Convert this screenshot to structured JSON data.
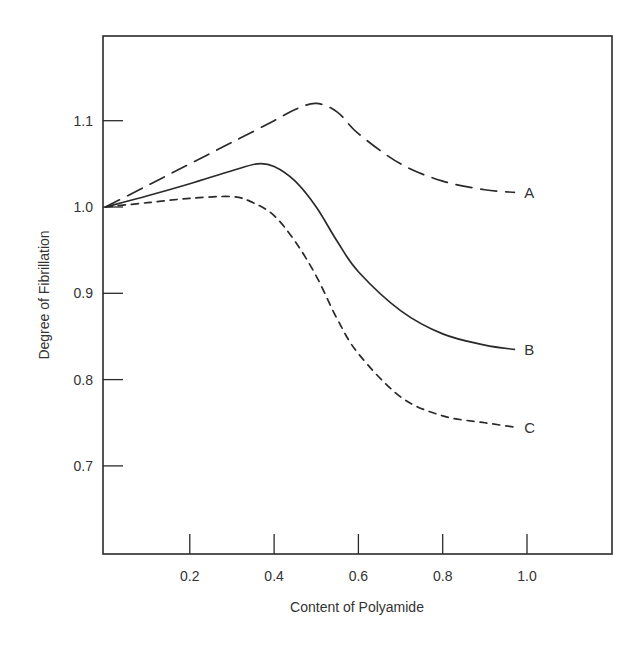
{
  "chart_data": {
    "type": "line",
    "title": "",
    "xlabel": "Content of Polyamide",
    "ylabel": "Degree of Fibrillation",
    "xlim": [
      0,
      1.18
    ],
    "ylim": [
      0.61,
      1.2
    ],
    "x_ticks": [
      0.2,
      0.4,
      0.6,
      0.8,
      1.0
    ],
    "x_tick_labels": [
      "0.2",
      "0.4",
      "0.6",
      "0.8",
      "1.0"
    ],
    "y_ticks": [
      0.7,
      0.8,
      0.9,
      1.0,
      1.1
    ],
    "y_tick_labels": [
      "0.7",
      "0.8",
      "0.9",
      "1.0",
      "1.1"
    ],
    "grid": false,
    "legend": "inline curve labels at right end",
    "series": [
      {
        "name": "A",
        "style": "long-dash",
        "x": [
          0.0,
          0.1,
          0.2,
          0.3,
          0.4,
          0.45,
          0.5,
          0.55,
          0.6,
          0.7,
          0.8,
          0.9,
          0.97
        ],
        "y": [
          1.0,
          1.025,
          1.05,
          1.075,
          1.1,
          1.113,
          1.12,
          1.11,
          1.085,
          1.05,
          1.03,
          1.02,
          1.017
        ]
      },
      {
        "name": "B",
        "style": "solid",
        "x": [
          0.0,
          0.1,
          0.2,
          0.3,
          0.36,
          0.4,
          0.45,
          0.5,
          0.55,
          0.6,
          0.7,
          0.8,
          0.9,
          0.97
        ],
        "y": [
          1.0,
          1.013,
          1.027,
          1.042,
          1.05,
          1.047,
          1.03,
          1.0,
          0.96,
          0.925,
          0.88,
          0.853,
          0.84,
          0.835
        ]
      },
      {
        "name": "C",
        "style": "short-dash",
        "x": [
          0.0,
          0.1,
          0.2,
          0.3,
          0.35,
          0.4,
          0.45,
          0.5,
          0.55,
          0.6,
          0.7,
          0.8,
          0.9,
          0.97
        ],
        "y": [
          1.0,
          1.005,
          1.01,
          1.012,
          1.005,
          0.99,
          0.96,
          0.92,
          0.87,
          0.83,
          0.78,
          0.758,
          0.75,
          0.745
        ]
      }
    ]
  },
  "colors": {
    "ink": "#2a2a2a",
    "background": "#ffffff"
  }
}
